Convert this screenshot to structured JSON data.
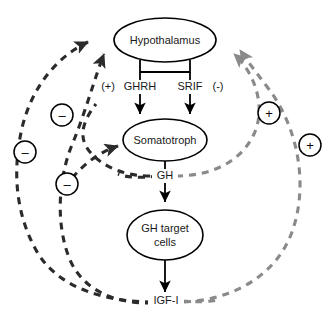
{
  "diagram": {
    "background_color": "#ffffff",
    "colors": {
      "stimulatory_dashed": "#8a8a8a",
      "inhibitory_dashed": "#2b2b2b",
      "solid_edge": "#000000",
      "text": "#1a1a1a"
    },
    "nodes": [
      {
        "id": "hypothalamus",
        "label": "Hypothalamus",
        "shape": "ellipse"
      },
      {
        "id": "somatotroph",
        "label": "Somatotroph",
        "shape": "ellipse"
      },
      {
        "id": "gh-target-cells",
        "label_line1": "GH target",
        "label_line2": "cells",
        "shape": "ellipse"
      }
    ],
    "edge_labels": {
      "ghrh_sign": "(+)",
      "ghrh": "GHRH",
      "srif": "SRIF",
      "srif_sign": "(-)",
      "gh": "GH",
      "igf1": "IGF-I"
    },
    "feedback_badges": [
      {
        "id": "badge-minus-outer-left",
        "sign": "–",
        "type": "inhibitory"
      },
      {
        "id": "badge-minus-upper-left",
        "sign": "–",
        "type": "inhibitory"
      },
      {
        "id": "badge-minus-lower-left",
        "sign": "–",
        "type": "inhibitory"
      },
      {
        "id": "badge-plus-inner-right",
        "sign": "+",
        "type": "stimulatory"
      },
      {
        "id": "badge-plus-outer-right",
        "sign": "+",
        "type": "stimulatory"
      }
    ]
  }
}
